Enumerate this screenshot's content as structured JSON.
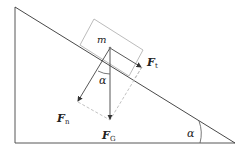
{
  "diagram": {
    "labels": {
      "mass": "m",
      "tangential_force": "F",
      "tangential_sub": "t",
      "normal_force": "F",
      "normal_sub": "n",
      "gravity_force": "F",
      "gravity_sub": "G",
      "angle_at_block": "α",
      "angle_at_base": "α"
    },
    "colors": {
      "line": "#333333",
      "block": "#999999",
      "dashed": "#bbbbbb",
      "text": "#222222"
    }
  }
}
